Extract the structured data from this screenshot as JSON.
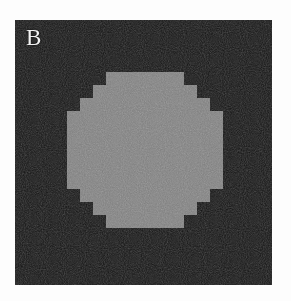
{
  "figure": {
    "panel_label": "B",
    "caption": "",
    "colors": {
      "page_background": "#fdfdfd",
      "panel_background": "#131313",
      "disk_fill": "#7b7b7b",
      "label_color": "#f2f2f2"
    },
    "panel": {
      "left": 15,
      "top": 20,
      "width": 257,
      "height": 265
    }
  },
  "chart_data": {
    "type": "heatmap",
    "title": "B",
    "subtitle": "",
    "xlabel": "",
    "ylabel": "",
    "grid": false,
    "legend": "none",
    "pixel_size": 13,
    "grid_cols": 20,
    "grid_rows": 20,
    "background_level": 18,
    "disk_level": 123,
    "disk_center_col": 9.6,
    "disk_center_row": 10.0,
    "disk_radius_cells": 5.75,
    "annotations": [
      {
        "text": "B",
        "x": 11,
        "y": 6
      }
    ],
    "row_runs": [
      {
        "row": 4,
        "start": 7,
        "end": 12
      },
      {
        "row": 5,
        "start": 6,
        "end": 13
      },
      {
        "row": 6,
        "start": 5,
        "end": 14
      },
      {
        "row": 7,
        "start": 4,
        "end": 15
      },
      {
        "row": 8,
        "start": 4,
        "end": 15
      },
      {
        "row": 9,
        "start": 4,
        "end": 15
      },
      {
        "row": 10,
        "start": 4,
        "end": 15
      },
      {
        "row": 11,
        "start": 4,
        "end": 15
      },
      {
        "row": 12,
        "start": 4,
        "end": 15
      },
      {
        "row": 13,
        "start": 5,
        "end": 14
      },
      {
        "row": 14,
        "start": 6,
        "end": 13
      },
      {
        "row": 15,
        "start": 7,
        "end": 12
      }
    ]
  }
}
